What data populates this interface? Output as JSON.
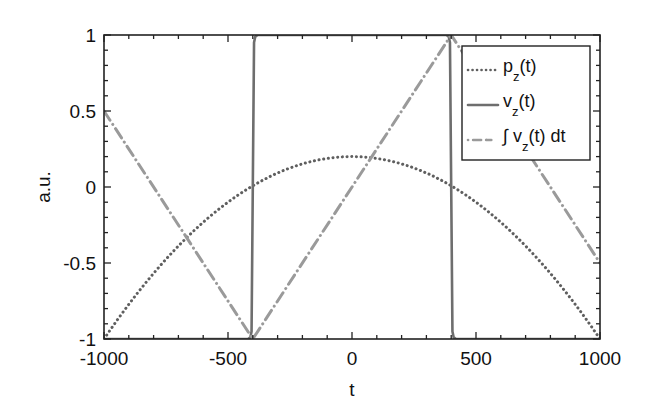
{
  "chart_data": {
    "type": "line",
    "title": "",
    "xlabel": "t",
    "ylabel": "a.u.",
    "xlim": [
      -1000,
      1000
    ],
    "ylim": [
      -1,
      1
    ],
    "xticks": [
      -1000,
      -500,
      0,
      500,
      1000
    ],
    "xtick_labels": [
      "-1000",
      "-500",
      "0",
      "500",
      "1000"
    ],
    "yticks": [
      -1,
      -0.5,
      0,
      0.5,
      1
    ],
    "ytick_labels": [
      "-1",
      "-0.5",
      "0",
      "0.5",
      "1"
    ],
    "x_minor_step": 100,
    "y_minor_step": 0.1,
    "grid": false,
    "legend_position": "upper right",
    "series": [
      {
        "name": "p_z(t)",
        "legend_main": "p",
        "legend_sub": "z",
        "legend_tail": "(t)",
        "style": "dotted",
        "color": "#5f5f5f",
        "x": [
          -1000,
          -900,
          -800,
          -700,
          -600,
          -500,
          -400,
          -300,
          -200,
          -100,
          0,
          100,
          200,
          300,
          400,
          500,
          600,
          700,
          800,
          900,
          1000
        ],
        "values": [
          -1.0,
          -0.772,
          -0.568,
          -0.388,
          -0.232,
          -0.1,
          0.008,
          0.092,
          0.152,
          0.188,
          0.2,
          0.188,
          0.152,
          0.092,
          0.008,
          -0.1,
          -0.232,
          -0.388,
          -0.568,
          -0.772,
          -1.0
        ]
      },
      {
        "name": "v_z(t)",
        "legend_main": "v",
        "legend_sub": "z",
        "legend_tail": "(t)",
        "style": "solid",
        "color": "#6e6e6e",
        "x": [
          -1000,
          -420,
          -410,
          -405,
          -400,
          -395,
          -390,
          -380,
          380,
          390,
          395,
          400,
          405,
          410,
          420,
          1000
        ],
        "values": [
          -1,
          -1,
          -0.99,
          -0.95,
          0,
          0.95,
          0.99,
          1,
          1,
          0.99,
          0.95,
          0,
          -0.95,
          -0.99,
          -1,
          -1
        ]
      },
      {
        "name": "∫ v_z(t) dt",
        "legend_main": "∫ v",
        "legend_sub": "z",
        "legend_tail": "(t) dt",
        "style": "dashdot",
        "color": "#9a9a9a",
        "x": [
          -1000,
          -400,
          400,
          1000
        ],
        "values": [
          0.5,
          -1,
          1,
          -0.5
        ]
      }
    ]
  }
}
